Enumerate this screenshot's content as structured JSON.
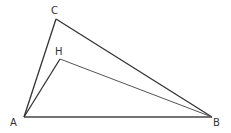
{
  "diagram": {
    "type": "triangle",
    "points": {
      "A": {
        "label": "A",
        "x": 24,
        "y": 117
      },
      "B": {
        "label": "B",
        "x": 212,
        "y": 117
      },
      "C": {
        "label": "C",
        "x": 56,
        "y": 19
      },
      "H": {
        "label": "H",
        "x": 60,
        "y": 59
      }
    },
    "segments": [
      "AB",
      "AC",
      "CB",
      "AH",
      "HB"
    ],
    "stroke_color": "#333333"
  }
}
